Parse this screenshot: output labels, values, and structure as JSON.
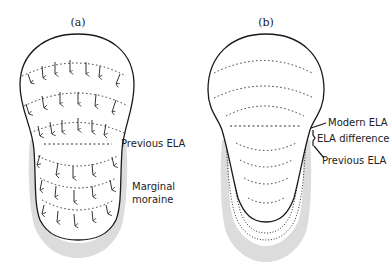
{
  "panels": [
    {
      "id": "a",
      "label": "(a)",
      "annotations": {
        "previous_ela": "Previous ELA",
        "moraine_line1": "Marginal",
        "moraine_line2": "moraine"
      }
    },
    {
      "id": "b",
      "label": "(b)",
      "annotations": {
        "modern_ela": "Modern ELA",
        "ela_difference": "ELA difference",
        "previous_ela": "Previous ELA"
      }
    }
  ],
  "colors": {
    "outline": "#1a1a1a",
    "moraine": "#dcdcdc",
    "flowline": "#333333",
    "background": "#ffffff"
  }
}
